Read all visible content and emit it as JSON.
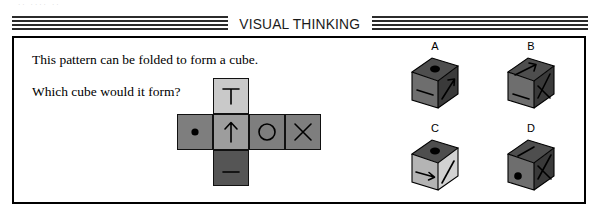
{
  "scan_remnant": "·· ···· ··",
  "header": {
    "title": "VISUAL THINKING"
  },
  "prompt": {
    "line1": "This pattern can be folded to form a cube.",
    "line2": "Which cube would it form?"
  },
  "net": {
    "description": "cube net cross pattern",
    "cells": [
      {
        "id": "top",
        "symbol": "T-shape",
        "shade": "#c9c9c9"
      },
      {
        "id": "left",
        "symbol": "filled-dot",
        "shade": "#7e7e7e"
      },
      {
        "id": "center",
        "symbol": "up-arrow",
        "shade": "#9d9d9d"
      },
      {
        "id": "right",
        "symbol": "circle-outline",
        "shade": "#7e7e7e"
      },
      {
        "id": "far-right",
        "symbol": "x-cross",
        "shade": "#7e7e7e"
      },
      {
        "id": "bottom",
        "symbol": "minus-bar",
        "shade": "#555555"
      }
    ]
  },
  "options": [
    {
      "label": "A",
      "top_face": "filled-dot",
      "left_face": "minus-bar",
      "right_face": "diagonal-arrow"
    },
    {
      "label": "B",
      "top_face": "diagonal-arrow",
      "left_face": "minus-bar",
      "right_face": "x-cross"
    },
    {
      "label": "C",
      "top_face": "filled-dot",
      "left_face": "right-arrow",
      "right_face": "diagonal-line"
    },
    {
      "label": "D",
      "top_face": "diagonal-line",
      "left_face": "filled-dot",
      "right_face": "x-cross"
    }
  ],
  "colors": {
    "ink": "#000000",
    "banner_stripe": "#2b2b2b",
    "net_light": "#c9c9c9",
    "net_mid": "#9d9d9d",
    "net_gray": "#7e7e7e",
    "net_dark": "#555555",
    "cube_top": "#4e4e4e",
    "cube_left": "#6e6e6e",
    "cube_right": "#3a3a3a",
    "cube_left_light": "#b4b4b4",
    "cube_right_light": "#d2d2d2"
  }
}
